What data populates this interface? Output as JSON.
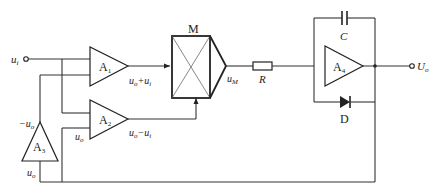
{
  "diagram": {
    "type": "circuit-schematic",
    "input": {
      "label": "u",
      "subscript": "i"
    },
    "output": {
      "label": "U",
      "subscript": "o"
    },
    "amplifiers": [
      {
        "id": "A1",
        "label": "A",
        "subscript": "1",
        "output_label": "u₀+uᵢ"
      },
      {
        "id": "A2",
        "label": "A",
        "subscript": "2",
        "output_label": "u₀−uᵢ",
        "input_label": "u₀"
      },
      {
        "id": "A3",
        "label": "A",
        "subscript": "3",
        "output_label": "−u₀",
        "input_label": "u₀"
      },
      {
        "id": "A4",
        "label": "A",
        "subscript": "4"
      }
    ],
    "multiplier": {
      "label": "M",
      "output_label": "u",
      "output_subscript": "M"
    },
    "resistor": {
      "label": "R"
    },
    "capacitor": {
      "label": "C"
    },
    "diode": {
      "label": "D"
    },
    "labels": {
      "ui": "u",
      "ui_sub": "i",
      "a1_out": "u",
      "a1_out_sub1": "o",
      "a1_out_plus": "+u",
      "a1_out_sub2": "i",
      "a2_out": "u",
      "a2_out_sub1": "o",
      "a2_out_minus": "−u",
      "a2_out_sub2": "i",
      "a2_in": "u",
      "a2_in_sub": "o",
      "a3_out": "−u",
      "a3_out_sub": "o",
      "a3_in": "u",
      "a3_in_sub": "o",
      "M": "M",
      "uM": "u",
      "uM_sub": "M",
      "R": "R",
      "C": "C",
      "D": "D",
      "A1": "A",
      "A1_sub": "1",
      "A2": "A",
      "A2_sub": "2",
      "A3": "A",
      "A3_sub": "3",
      "A4": "A",
      "A4_sub": "4",
      "Uo": "U",
      "Uo_sub": "o"
    }
  }
}
